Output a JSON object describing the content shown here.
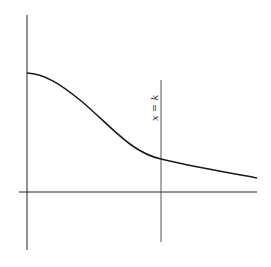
{
  "diagram": {
    "label_line": "x = k",
    "colors": {
      "axes": "#222222",
      "curve": "#1a1a1a",
      "vline": "#555555",
      "background": "#ffffff"
    }
  }
}
